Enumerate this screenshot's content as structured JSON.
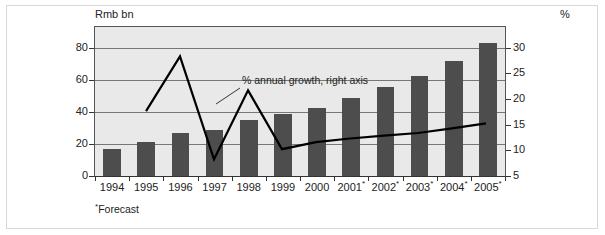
{
  "chart_data": {
    "type": "bar",
    "title": "",
    "subtitle": "",
    "ylabel": "Rmb bn",
    "ylabel_right": "%",
    "xlabel": "",
    "grid": true,
    "legend_position": "annotation",
    "footnote": "Forecast",
    "footnote_marker": "*",
    "annotation": "% annual growth, right axis",
    "categories": [
      "1994",
      "1995",
      "1996",
      "1997",
      "1998",
      "1999",
      "2000",
      "2001",
      "2002",
      "2003",
      "2004",
      "2005"
    ],
    "category_markers": [
      "",
      "",
      "",
      "",
      "",
      "",
      "",
      "*",
      "*",
      "*",
      "*",
      "*"
    ],
    "ylim": [
      0,
      93
    ],
    "yticks": [
      "0",
      "20",
      "40",
      "60",
      "80"
    ],
    "ytick_values": [
      0,
      20,
      40,
      60,
      80
    ],
    "ylim_right": [
      5,
      34
    ],
    "yticks_right": [
      "5",
      "10",
      "15",
      "20",
      "25",
      "30"
    ],
    "ytick_right_values": [
      5,
      10,
      15,
      20,
      25,
      30
    ],
    "series": [
      {
        "name": "Rmb bn",
        "type": "bar",
        "axis": "left",
        "color": "#4d4d4d",
        "values": [
          17,
          21.5,
          27,
          29,
          35,
          38.5,
          42.5,
          48.5,
          55.5,
          62.5,
          72,
          83
        ]
      },
      {
        "name": "% annual growth, right axis",
        "type": "line",
        "axis": "right",
        "color": "#000000",
        "x": [
          "1995",
          "1996",
          "1997",
          "1998",
          "1999",
          "2000",
          "2001",
          "2002",
          "2003",
          "2004",
          "2005"
        ],
        "values": [
          17.4,
          28.2,
          7.9,
          21.5,
          9.9,
          11.3,
          12.0,
          12.6,
          13.1,
          14.0,
          15.0
        ]
      }
    ]
  },
  "colors": {
    "bar": "#4d4d4d",
    "line": "#000000",
    "plot_background": "#e9e9e9",
    "grid": "#777777",
    "frame": "#555555",
    "page_background": "#ffffff"
  }
}
